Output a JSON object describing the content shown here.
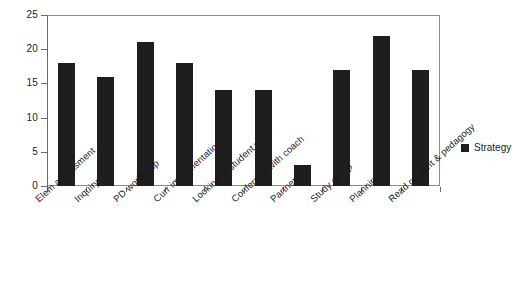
{
  "chart_data": {
    "type": "bar",
    "title": "",
    "xlabel": "",
    "ylabel": "",
    "categories": [
      "Elem assessment",
      "Inquiry",
      "PD workshop",
      "Curr implementation",
      "Looking at student work",
      "Conferring with coach",
      "Partners",
      "Study group",
      "Planning",
      "Read content & pedagogy"
    ],
    "series": [
      {
        "name": "Strategy",
        "values": [
          18,
          16,
          21,
          18,
          14,
          14,
          3,
          17,
          22,
          17
        ],
        "color": "#1e1e1e"
      }
    ],
    "ylim": [
      0,
      25
    ],
    "yticks": [
      0,
      5,
      10,
      15,
      20,
      25
    ],
    "ytick_labels": [
      "0",
      "5",
      "10",
      "15",
      "20",
      "25"
    ],
    "grid": "horizontal",
    "legend_position": "right",
    "legend_entries": [
      "Strategy"
    ]
  },
  "legend": {
    "swatch_name": "legend-color-swatch",
    "label": "Strategy"
  }
}
